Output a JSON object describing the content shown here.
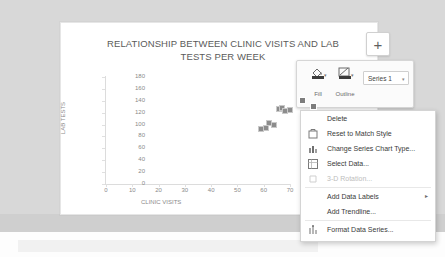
{
  "chart": {
    "title": "RELATIONSHIP BETWEEN CLINIC VISITS AND LAB TESTS PER WEEK",
    "title_line1": "RELATIONSHIP BETWEEN CLINIC VISITS AND LAB",
    "title_line2": "TESTS PER WEEK",
    "plus_button": "+"
  },
  "chart_data": {
    "type": "scatter",
    "title": "RELATIONSHIP BETWEEN CLINIC VISITS AND LAB TESTS PER WEEK",
    "xlabel": "CLINIC VISITS",
    "ylabel": "LAB TESTS",
    "xlim": [
      0,
      70
    ],
    "ylim": [
      0,
      180
    ],
    "xticks": [
      0,
      10,
      20,
      30,
      40,
      50,
      60,
      70
    ],
    "yticks": [
      0,
      20,
      40,
      60,
      80,
      100,
      120,
      140,
      160,
      180
    ],
    "grid": false,
    "legend": false,
    "series": [
      {
        "name": "Series 1",
        "marker_color": "#8c8c8c",
        "points": [
          {
            "x": 59,
            "y": 92
          },
          {
            "x": 61,
            "y": 95
          },
          {
            "x": 62,
            "y": 102
          },
          {
            "x": 64,
            "y": 100
          },
          {
            "x": 66,
            "y": 127
          },
          {
            "x": 67,
            "y": 128
          },
          {
            "x": 68,
            "y": 122
          },
          {
            "x": 70,
            "y": 125
          }
        ]
      }
    ]
  },
  "mini_toolbar": {
    "fill_label": "Fill",
    "outline_label": "Outline",
    "series_select_value": "Series 1",
    "caret": "▾"
  },
  "context_menu": {
    "items": [
      {
        "label": "Delete",
        "icon": "",
        "disabled": false,
        "submenu": false
      },
      {
        "label": "Reset to Match Style",
        "icon": "reset-style-icon",
        "disabled": false,
        "submenu": false
      },
      {
        "label": "Change Series Chart Type...",
        "icon": "chart-type-icon",
        "disabled": false,
        "submenu": false
      },
      {
        "label": "Select Data...",
        "icon": "select-data-icon",
        "disabled": false,
        "submenu": false
      },
      {
        "label": "3-D Rotation...",
        "icon": "rotation-icon",
        "disabled": true,
        "submenu": false
      },
      {
        "label": "Add Data Labels",
        "icon": "",
        "disabled": false,
        "submenu": true
      },
      {
        "label": "Add Trendline...",
        "icon": "",
        "disabled": false,
        "submenu": false
      },
      {
        "label": "Format Data Series...",
        "icon": "format-series-icon",
        "disabled": false,
        "submenu": false
      }
    ],
    "submenu_arrow": "▸"
  },
  "colors": {
    "marker": "#8c8c8c",
    "axis": "#dcdcdc",
    "tick_text": "#8a8a8a",
    "title_text": "#5a5a5a",
    "menu_text": "#3a3a3a",
    "menu_disabled": "#bdbdbd",
    "canvas_bg": "#d8d8d8"
  }
}
